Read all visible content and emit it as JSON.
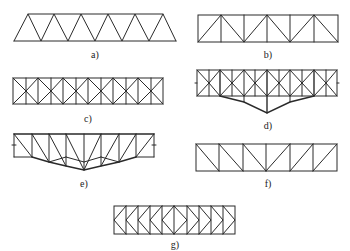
{
  "figure": {
    "trusses": [
      {
        "id": "a",
        "label": "a)",
        "type": "warren-trapezoid",
        "panels": 5
      },
      {
        "id": "b",
        "label": "b)",
        "type": "warren-with-verticals",
        "panels": 6
      },
      {
        "id": "c",
        "label": "c)",
        "type": "k-diamond-lattice",
        "panels": 6
      },
      {
        "id": "d",
        "label": "d)",
        "type": "diamond-lattice-with-sagging-bottom-chord",
        "panels": 6
      },
      {
        "id": "e",
        "label": "e)",
        "type": "pratt-with-polygonal-bottom-chord",
        "panels": 8
      },
      {
        "id": "f",
        "label": "f)",
        "type": "pratt",
        "panels": 6
      },
      {
        "id": "g",
        "label": "g)",
        "type": "k-truss",
        "panels": 10
      }
    ]
  },
  "colors": {
    "line": "#2a2a2a",
    "background": "#ffffff"
  }
}
